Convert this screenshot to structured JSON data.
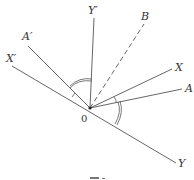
{
  "diagram": {
    "origin_label": "0",
    "labels": {
      "Yp": "Y′",
      "B": "B",
      "Ap": "A′",
      "Xp": "X′",
      "X": "X",
      "A": "A",
      "Y": "Y"
    },
    "caption": "图 1"
  }
}
